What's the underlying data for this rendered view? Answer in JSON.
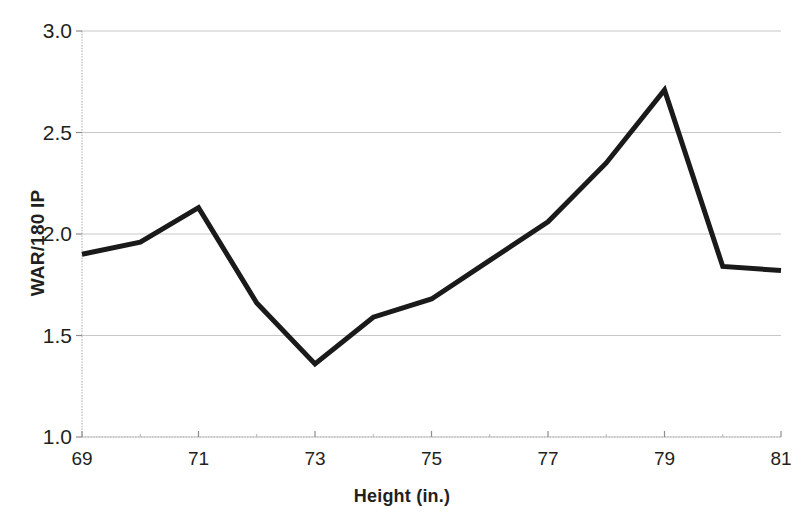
{
  "chart_data": {
    "type": "line",
    "title": "",
    "subtitle": "",
    "xlabel": "Height (in.)",
    "ylabel": "WAR/180 IP",
    "x": [
      69,
      70,
      71,
      72,
      73,
      74,
      75,
      76,
      77,
      78,
      79,
      80,
      81
    ],
    "values": [
      1.9,
      1.96,
      2.13,
      1.66,
      1.36,
      1.59,
      1.68,
      1.87,
      2.06,
      2.35,
      2.71,
      1.84,
      1.82
    ],
    "series": [
      {
        "name": "WAR/180 IP",
        "values": [
          1.9,
          1.96,
          2.13,
          1.66,
          1.36,
          1.59,
          1.68,
          1.87,
          2.06,
          2.35,
          2.71,
          1.84,
          1.82
        ]
      }
    ],
    "xlim": [
      69,
      81
    ],
    "ylim": [
      1.0,
      3.0
    ],
    "x_tick_labels": [
      "69",
      "71",
      "73",
      "75",
      "77",
      "79",
      "81"
    ],
    "x_tick_values": [
      69,
      71,
      73,
      75,
      77,
      79,
      81
    ],
    "x_minor_tick_values": [
      70,
      72,
      74,
      76,
      78,
      80
    ],
    "y_tick_labels": [
      "1.0",
      "1.5",
      "2.0",
      "2.5",
      "3.0"
    ],
    "y_tick_values": [
      1.0,
      1.5,
      2.0,
      2.5,
      3.0
    ],
    "grid": true,
    "grid_axis": "y",
    "legend": false,
    "legend_position": "none",
    "line_color": "#1a1a1a",
    "line_width": 5,
    "grid_color": "#c8c8c8",
    "axis_color": "#b0b0b0",
    "background_color": "#ffffff",
    "markers": false,
    "annotations": []
  }
}
